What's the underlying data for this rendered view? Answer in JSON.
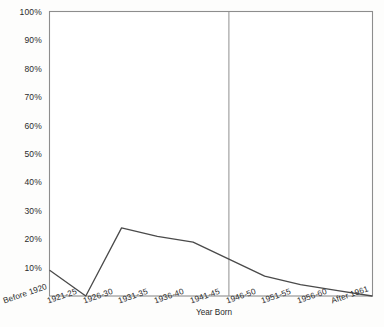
{
  "chart_data": {
    "type": "line",
    "title": "",
    "xlabel": "Year Born",
    "ylabel": "",
    "categories": [
      "Before 1920",
      "1921-25",
      "1926-30",
      "1931-35",
      "1936-40",
      "1941-45",
      "1946-50",
      "1951-55",
      "1956-60",
      "After 1961"
    ],
    "values": [
      9,
      0,
      24,
      21,
      19,
      13,
      7,
      4,
      2,
      0
    ],
    "ylim": [
      0,
      100
    ],
    "ytick_labels": [
      "10%",
      "20%",
      "30%",
      "40%",
      "50%",
      "60%",
      "70%",
      "80%",
      "90%",
      "100%"
    ],
    "ytick_values": [
      10,
      20,
      30,
      40,
      50,
      60,
      70,
      80,
      90,
      100
    ],
    "grid": false,
    "legend": "none",
    "annotations": [
      {
        "name": "vertical-reference-line",
        "type": "vline",
        "at_category": "1941-45",
        "value": 5
      }
    ],
    "line_color": "#4a4a4a",
    "axis_color": "#8a8a8a"
  }
}
